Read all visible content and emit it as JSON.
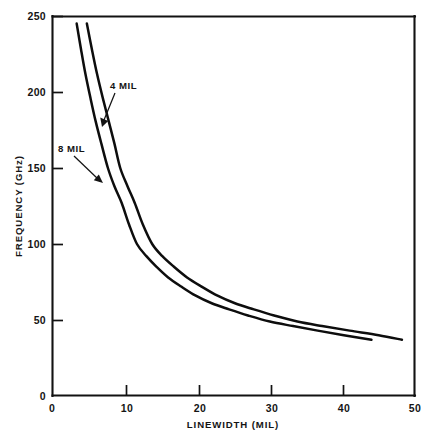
{
  "chart_data": {
    "type": "line",
    "title": "",
    "xlabel": "LINEWIDTH (MIL)",
    "ylabel": "FREQUENCY (GHz)",
    "xlim": [
      0,
      50
    ],
    "ylim": [
      0,
      250
    ],
    "xticks": [
      0,
      10,
      20,
      30,
      40,
      50
    ],
    "yticks": [
      0,
      50,
      100,
      150,
      200,
      250
    ],
    "xtick_labels": [
      "0",
      "10",
      "20",
      "30",
      "40",
      "50"
    ],
    "ytick_labels": [
      "0",
      "50",
      "100",
      "150",
      "200",
      "250"
    ],
    "grid": false,
    "legend": "inline-annotations",
    "series": [
      {
        "name": "8 MIL",
        "label": "8 MIL",
        "color": "#0d0d0d",
        "x": [
          3.4,
          4.0,
          4.6,
          5.3,
          6.0,
          6.8,
          7.7,
          8.6,
          9.6,
          10.6,
          11.7,
          13.0,
          14.4,
          16.0,
          17.8,
          19.8,
          22.0,
          24.4,
          27.0,
          30.0,
          33.2,
          36.6,
          40.2,
          44.0
        ],
        "y": [
          245,
          228,
          212,
          196,
          181,
          166,
          150,
          138,
          127,
          113,
          100,
          92,
          85,
          78,
          72,
          66,
          61,
          57,
          53,
          49,
          46,
          43,
          40,
          37
        ]
      },
      {
        "name": "4 MIL",
        "label": "4 MIL",
        "color": "#0d0d0d",
        "x": [
          4.8,
          5.5,
          6.2,
          7.0,
          7.8,
          8.6,
          9.4,
          10.4,
          11.4,
          12.5,
          13.8,
          15.2,
          16.8,
          18.6,
          20.6,
          22.8,
          25.2,
          27.8,
          30.6,
          33.8,
          37.2,
          41.0,
          45.0,
          48.2
        ],
        "y": [
          245,
          228,
          212,
          196,
          181,
          166,
          150,
          138,
          127,
          113,
          100,
          92,
          85,
          78,
          72,
          66,
          61,
          57,
          53,
          49,
          46,
          43,
          40,
          37
        ]
      }
    ],
    "annotations": [
      {
        "text": "4 MIL",
        "label_x": 110,
        "label_y": 89,
        "leader_from": [
          115,
          93
        ],
        "leader_to": [
          103,
          123
        ]
      },
      {
        "text": "8 MIL",
        "label_x": 58,
        "label_y": 152,
        "leader_from": [
          74,
          157
        ],
        "leader_to": [
          101,
          182
        ]
      }
    ]
  },
  "axis_geometry": {
    "plot_left": 52,
    "plot_right": 415,
    "plot_top": 16,
    "plot_bottom": 396
  }
}
